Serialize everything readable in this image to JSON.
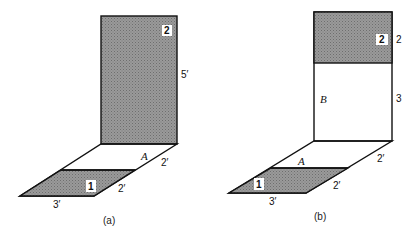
{
  "figure": {
    "colors": {
      "shade": "#8a8a8a",
      "line": "#111111",
      "background": "#ffffff"
    },
    "panels": [
      {
        "id": "a",
        "caption": "(a)",
        "surfaces": {
          "surface_1": {
            "label": "1",
            "shaded": true
          },
          "surface_2": {
            "label": "2",
            "shaded": true
          }
        },
        "labels": {
          "area_A": "A",
          "height": "5′",
          "depth_back": "2′",
          "depth_front": "2′",
          "width": "3′"
        }
      },
      {
        "id": "b",
        "caption": "(b)",
        "surfaces": {
          "surface_1": {
            "label": "1",
            "shaded": true
          },
          "surface_2": {
            "label": "2",
            "shaded": true
          }
        },
        "labels": {
          "area_A": "A",
          "area_B": "B",
          "height_top": "2",
          "height_bottom": "3",
          "depth_back": "2′",
          "depth_front": "2′",
          "width": "3′"
        }
      }
    ]
  }
}
